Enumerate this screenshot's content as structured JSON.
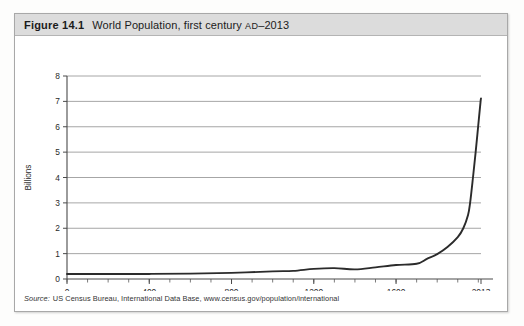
{
  "figure": {
    "number": "Figure 14.1",
    "title_main": "World Population, first century ",
    "title_era": "AD",
    "title_tail": "–2013",
    "full_title": "World Population, first century AD–2013"
  },
  "source": {
    "label": "Source:",
    "text": "US Census Bureau, International Data Base, www.census.gov/population/international"
  },
  "chart_data": {
    "type": "line",
    "title": "World Population, first century AD–2013",
    "xlabel": "",
    "ylabel": "Billions",
    "xlim": [
      0,
      2013
    ],
    "ylim": [
      0,
      8
    ],
    "grid": true,
    "legend": false,
    "x_major_ticks": [
      0,
      400,
      800,
      1200,
      1600,
      2013
    ],
    "x_major_tick_labels": [
      "0",
      "400",
      "800",
      "1200",
      "1600",
      "2013"
    ],
    "x_minor_tick_step": 100,
    "y_ticks": [
      0,
      1,
      2,
      3,
      4,
      5,
      6,
      7,
      8
    ],
    "y_tick_labels": [
      "0",
      "1",
      "2",
      "3",
      "4",
      "5",
      "6",
      "7",
      "8"
    ],
    "line_color": "#2b2b2b",
    "series": [
      {
        "name": "World population",
        "units": "billions",
        "x": [
          0,
          200,
          400,
          600,
          800,
          1000,
          1100,
          1200,
          1300,
          1400,
          1500,
          1600,
          1700,
          1750,
          1800,
          1850,
          1900,
          1927,
          1950,
          1960,
          1974,
          1987,
          1999,
          2011,
          2013
        ],
        "values": [
          0.2,
          0.2,
          0.2,
          0.21,
          0.24,
          0.3,
          0.32,
          0.4,
          0.43,
          0.38,
          0.46,
          0.55,
          0.6,
          0.79,
          0.98,
          1.26,
          1.65,
          2.0,
          2.52,
          3.0,
          4.0,
          5.0,
          6.0,
          7.0,
          7.1
        ]
      }
    ]
  }
}
